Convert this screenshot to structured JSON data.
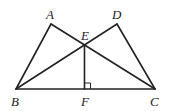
{
  "figure": {
    "type": "geometry",
    "points": {
      "A": {
        "label": "A"
      },
      "B": {
        "label": "B"
      },
      "C": {
        "label": "C"
      },
      "D": {
        "label": "D"
      },
      "E": {
        "label": "E"
      },
      "F": {
        "label": "F"
      }
    },
    "segments": [
      [
        "A",
        "B"
      ],
      [
        "A",
        "C"
      ],
      [
        "D",
        "B"
      ],
      [
        "D",
        "C"
      ],
      [
        "B",
        "C"
      ],
      [
        "E",
        "F"
      ]
    ],
    "right_angle": {
      "at": "F",
      "between": [
        "E",
        "C"
      ]
    },
    "color": "#222222"
  }
}
